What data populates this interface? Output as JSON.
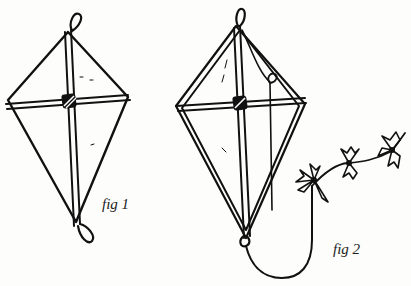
{
  "figures": [
    {
      "id": "fig1",
      "label": "fig 1"
    },
    {
      "id": "fig2",
      "label": "fig 2"
    }
  ],
  "colors": {
    "ink": "#111111",
    "paper": "#fdfdfb"
  }
}
